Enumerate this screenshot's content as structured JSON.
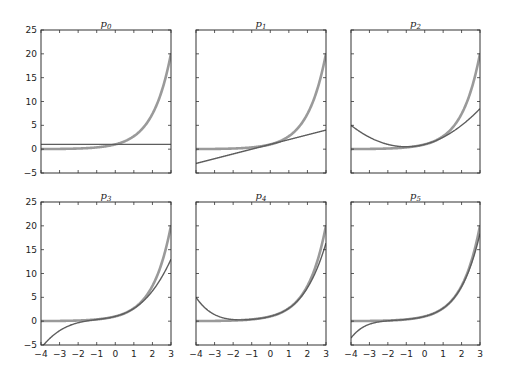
{
  "chart_data": {
    "type": "line",
    "layout": "2x3 subplot grid",
    "xlim": [
      -4,
      3
    ],
    "ylim": [
      -5,
      25
    ],
    "xticks": [
      -4,
      -3,
      -2,
      -1,
      0,
      1,
      2,
      3
    ],
    "yticks": [
      -5,
      0,
      5,
      10,
      15,
      20,
      25
    ],
    "xtick_labels": [
      "−4",
      "−3",
      "−2",
      "−1",
      "0",
      "1",
      "2",
      "3"
    ],
    "ytick_labels": [
      "−5",
      "0",
      "5",
      "10",
      "15",
      "20",
      "25"
    ],
    "grid": false,
    "colors": {
      "reference": "#9a9a9a",
      "approximation": "#5e5e5e",
      "frame": "#333333"
    },
    "reference_curve": {
      "name": "e^x",
      "coefficients": [
        1,
        1,
        0.5,
        0.16667,
        0.041667,
        0.0083333
      ]
    },
    "panels": [
      {
        "title": "p",
        "subscript": "0",
        "degree": 0,
        "show_yticks": true,
        "show_xticks": false
      },
      {
        "title": "p",
        "subscript": "1",
        "degree": 1,
        "show_yticks": false,
        "show_xticks": false
      },
      {
        "title": "p",
        "subscript": "2",
        "degree": 2,
        "show_yticks": false,
        "show_xticks": false
      },
      {
        "title": "p",
        "subscript": "3",
        "degree": 3,
        "show_yticks": true,
        "show_xticks": true
      },
      {
        "title": "p",
        "subscript": "4",
        "degree": 4,
        "show_yticks": false,
        "show_xticks": true
      },
      {
        "title": "p",
        "subscript": "5",
        "degree": 5,
        "show_yticks": false,
        "show_xticks": true
      }
    ]
  }
}
